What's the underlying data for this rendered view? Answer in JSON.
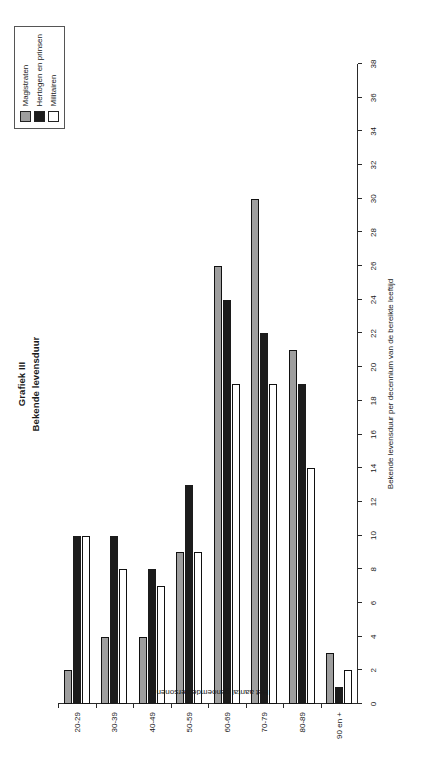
{
  "figure": {
    "title_line_1": "Grafiek III",
    "title_line_2": "Bekende levensduur"
  },
  "legend": {
    "position": "top-right",
    "items": [
      {
        "label": "Magistraten",
        "color": "#9e9e9e"
      },
      {
        "label": "Hertogen en prinsen",
        "color": "#1c1c1c"
      },
      {
        "label": "Militairen",
        "color": "#ffffff"
      }
    ]
  },
  "chart_data": {
    "type": "bar",
    "orientation": "vertical",
    "xlabel": "Bekende levensduur per decennium van de bereikte leeftijd",
    "ylabel": "Het aantal genoemde personen",
    "categories": [
      "20-29",
      "30-39",
      "40-49",
      "50-59",
      "60-69",
      "70-79",
      "80-89",
      "90 en +"
    ],
    "ylim": [
      0,
      38
    ],
    "yticks": [
      0,
      2,
      4,
      6,
      8,
      10,
      12,
      14,
      16,
      18,
      20,
      22,
      24,
      26,
      28,
      30,
      32,
      34,
      36,
      38
    ],
    "grid": false,
    "series": [
      {
        "name": "Magistraten",
        "color": "#9e9e9e",
        "values": [
          2,
          4,
          4,
          9,
          26,
          30,
          21,
          3
        ]
      },
      {
        "name": "Hertogen en prinsen",
        "color": "#1c1c1c",
        "values": [
          10,
          10,
          8,
          13,
          24,
          22,
          19,
          1
        ]
      },
      {
        "name": "Militairen",
        "color": "#ffffff",
        "values": [
          10,
          8,
          7,
          9,
          19,
          19,
          14,
          2
        ]
      }
    ]
  }
}
